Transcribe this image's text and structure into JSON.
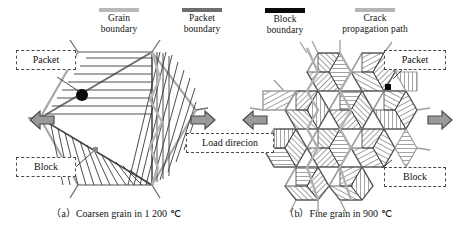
{
  "figure": {
    "legend": [
      {
        "key": "grain",
        "label_line1": "Grain",
        "label_line2": "boundary",
        "color": "#b9b9b9",
        "style": "thick-light-gray-line"
      },
      {
        "key": "packet",
        "label_line1": "Packet",
        "label_line2": "boundary",
        "color": "#6e6e6e",
        "style": "thick-medium-gray-line"
      },
      {
        "key": "block",
        "label_line1": "Block",
        "label_line2": "boundary",
        "color": "#0b0b0b",
        "style": "thick-black-line"
      },
      {
        "key": "crack",
        "label_line1": "Crack",
        "label_line2": "propagation path",
        "color": "#b5b5b5",
        "style": "thick-light-gray-line"
      }
    ],
    "panels": [
      {
        "id": "a",
        "caption": "（a）Coarsen grain in 1 200 ℃",
        "caption_index": "（a）",
        "caption_text": "Coarsen grain in 1 200 ℃",
        "temperature": "1 200 ℃",
        "grain_type": "Coarsen grain",
        "tags": [
          {
            "name": "packet",
            "label": "Packet"
          },
          {
            "name": "block",
            "label": "Block"
          }
        ],
        "crack_initiation_marker": "black-filled-circle"
      },
      {
        "id": "b",
        "caption": "（b）Fine grain in 900 ℃",
        "caption_index": "（b）",
        "caption_text": "Fine grain in 900 ℃",
        "temperature": "900 ℃",
        "grain_type": "Fine grain",
        "tags": [
          {
            "name": "packet",
            "label": "Packet"
          },
          {
            "name": "block",
            "label": "Block"
          }
        ],
        "crack_initiation_marker": "black-filled-square"
      }
    ],
    "load": {
      "label": "Load direcion",
      "arrow_color": "#9a9a9a",
      "arrow_stroke": "#4a4a4a",
      "arrows": [
        {
          "name": "outer-left-arrow",
          "direction": "left"
        },
        {
          "name": "inner-left-arrow",
          "direction": "right"
        },
        {
          "name": "inner-right-arrow",
          "direction": "left"
        },
        {
          "name": "outer-right-arrow",
          "direction": "right"
        }
      ]
    },
    "colors": {
      "background": "#ffffff",
      "line": "#3a3a3a",
      "hatch": "#555555",
      "grain_boundary": "#b9b9b9",
      "packet_boundary": "#6e6e6e",
      "block_boundary": "#0b0b0b"
    }
  }
}
